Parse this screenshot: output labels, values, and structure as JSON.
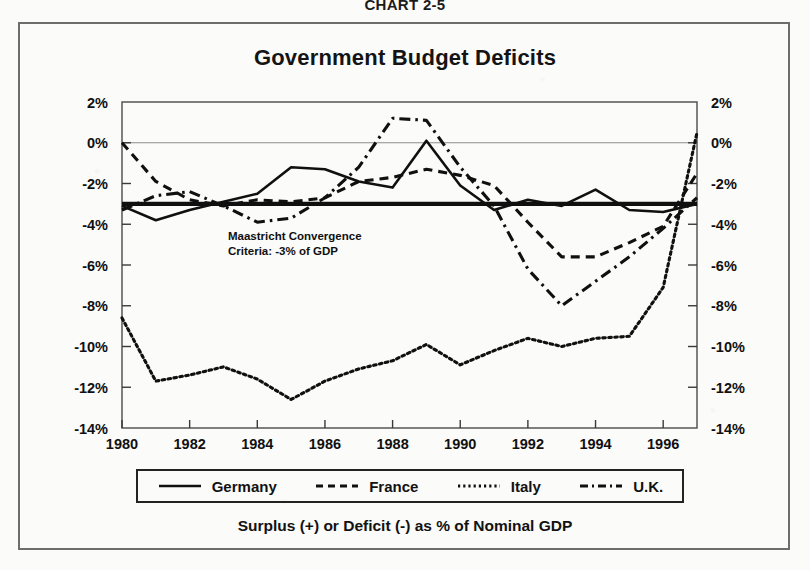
{
  "figure": {
    "chart_number": "CHART 2-5",
    "title": "Government Budget Deficits",
    "caption": "Surplus (+)  or Deficit (-) as % of Nominal GDP",
    "annotation_line1": "Maastricht Convergence",
    "annotation_line2": "Criteria: -3% of GDP"
  },
  "legend": {
    "items": [
      {
        "label": "Germany",
        "style": "solid"
      },
      {
        "label": "France",
        "style": "dashed"
      },
      {
        "label": "Italy",
        "style": "dotted"
      },
      {
        "label": "U.K.",
        "style": "dash-dot"
      }
    ]
  },
  "colors": {
    "ink": "#101010",
    "frame": "#6d6d6d",
    "gridline": "#8d8d8d",
    "page": "#fbfbfa"
  },
  "chart_data": {
    "type": "line",
    "title": "Government Budget Deficits",
    "subtitle": "Surplus (+)  or Deficit (-) as % of Nominal GDP",
    "xlabel": "",
    "ylabel": "",
    "xlim": [
      1980,
      1997
    ],
    "ylim": [
      -14,
      2
    ],
    "yticks": [
      2,
      0,
      -2,
      -4,
      -6,
      -8,
      -10,
      -12,
      -14
    ],
    "ytick_labels": [
      "2%",
      "0%",
      "-2%",
      "-4%",
      "-6%",
      "-8%",
      "-10%",
      "-12%",
      "-14%"
    ],
    "xticks": [
      1980,
      1982,
      1984,
      1986,
      1988,
      1990,
      1992,
      1994,
      1996
    ],
    "xtick_labels": [
      "1980",
      "1982",
      "1984",
      "1986",
      "1988",
      "1990",
      "1992",
      "1994",
      "1996"
    ],
    "x": [
      1980,
      1981,
      1982,
      1983,
      1984,
      1985,
      1986,
      1987,
      1988,
      1989,
      1990,
      1991,
      1992,
      1993,
      1994,
      1995,
      1996,
      1997
    ],
    "grid": "y-zero-only",
    "legend_position": "bottom",
    "reference_line": {
      "value": -3,
      "label": "Maastricht Convergence Criteria: -3% of GDP"
    },
    "series": [
      {
        "name": "Germany",
        "style": "solid",
        "values": [
          -3.1,
          -3.8,
          -3.3,
          -2.9,
          -2.5,
          -1.2,
          -1.3,
          -1.9,
          -2.2,
          0.1,
          -2.1,
          -3.3,
          -2.8,
          -3.1,
          -2.3,
          -3.3,
          -3.4,
          -3.0
        ]
      },
      {
        "name": "France",
        "style": "dashed",
        "values": [
          0.0,
          -1.9,
          -2.8,
          -3.1,
          -2.8,
          -2.9,
          -2.7,
          -1.9,
          -1.7,
          -1.3,
          -1.6,
          -2.1,
          -3.9,
          -5.6,
          -5.6,
          -4.9,
          -4.1,
          -1.5
        ]
      },
      {
        "name": "Italy",
        "style": "dotted",
        "values": [
          -8.6,
          -11.7,
          -11.4,
          -11.0,
          -11.6,
          -12.6,
          -11.7,
          -11.1,
          -10.7,
          -9.9,
          -10.9,
          -10.2,
          -9.6,
          -10.0,
          -9.6,
          -9.5,
          -7.1,
          0.5
        ]
      },
      {
        "name": "U.K.",
        "style": "dash-dot",
        "values": [
          -3.3,
          -2.6,
          -2.4,
          -3.1,
          -3.9,
          -3.7,
          -2.7,
          -1.2,
          1.2,
          1.1,
          -1.2,
          -3.1,
          -6.2,
          -8.0,
          -6.8,
          -5.6,
          -4.2,
          -2.7
        ]
      }
    ]
  }
}
